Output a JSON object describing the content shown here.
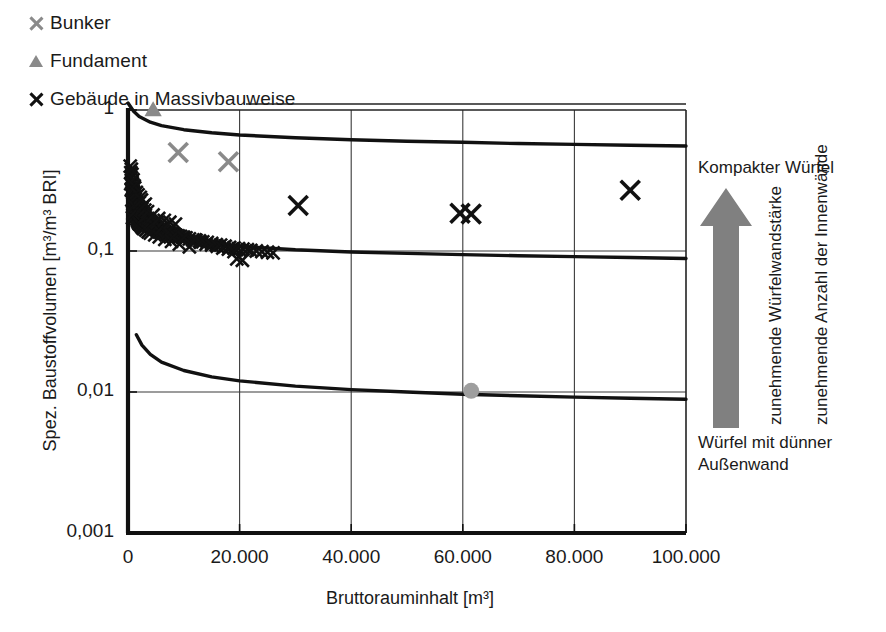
{
  "legend": {
    "items": [
      {
        "label": "Bunker",
        "marker": "x-icon",
        "color": "#8a8a8a"
      },
      {
        "label": "Fundament",
        "marker": "triangle-icon",
        "color": "#8a8a8a"
      },
      {
        "label": "Gebäude in Massivbauweise",
        "marker": "x-icon",
        "color": "#111111"
      }
    ]
  },
  "annotation": {
    "top_label": "Kompakter Würfel",
    "arrow_label_1": "zunehmende Würfelwandstärke",
    "arrow_label_2": "zunehmende Anzahl der Innenwände",
    "bottom_label_line1": "Würfel mit dünner",
    "bottom_label_line2": "Außenwand",
    "arrow_color": "#808080",
    "arrow_icon": "up-arrow-icon"
  },
  "chart_data": {
    "type": "scatter",
    "title": "",
    "xlabel": "Bruttorauminhalt [m³]",
    "ylabel": "Spez. Baustoffvolumen [m³/m³ BRI]",
    "xlim": [
      0,
      100000
    ],
    "ylim": [
      0.001,
      1
    ],
    "yscale": "log",
    "xscale": "linear",
    "xticks": [
      0,
      20000,
      40000,
      60000,
      80000,
      100000
    ],
    "xtick_labels": [
      "0",
      "20.000",
      "40.000",
      "60.000",
      "80.000",
      "100.000"
    ],
    "yticks": [
      1,
      0.1,
      0.01,
      0.001
    ],
    "ytick_labels": [
      "1",
      "0,1",
      "0,01",
      "0,001"
    ],
    "grid": true,
    "legend_position": "top-left-outside",
    "series": [
      {
        "name": "Gebäude in Massivbauweise",
        "marker": "x",
        "color": "#111111",
        "points": [
          [
            400,
            0.4
          ],
          [
            500,
            0.36
          ],
          [
            600,
            0.33
          ],
          [
            700,
            0.31
          ],
          [
            800,
            0.3
          ],
          [
            600,
            0.27
          ],
          [
            900,
            0.28
          ],
          [
            1000,
            0.26
          ],
          [
            1100,
            0.25
          ],
          [
            1200,
            0.24
          ],
          [
            700,
            0.23
          ],
          [
            1300,
            0.235
          ],
          [
            1400,
            0.225
          ],
          [
            900,
            0.215
          ],
          [
            1500,
            0.22
          ],
          [
            1600,
            0.21
          ],
          [
            1000,
            0.205
          ],
          [
            1700,
            0.2
          ],
          [
            1800,
            0.198
          ],
          [
            1200,
            0.195
          ],
          [
            1900,
            0.192
          ],
          [
            2000,
            0.19
          ],
          [
            1300,
            0.188
          ],
          [
            2100,
            0.186
          ],
          [
            2200,
            0.183
          ],
          [
            1400,
            0.181
          ],
          [
            2300,
            0.179
          ],
          [
            2400,
            0.177
          ],
          [
            1500,
            0.175
          ],
          [
            2500,
            0.173
          ],
          [
            800,
            0.172
          ],
          [
            2600,
            0.17
          ],
          [
            1600,
            0.169
          ],
          [
            2700,
            0.167
          ],
          [
            2800,
            0.166
          ],
          [
            1700,
            0.165
          ],
          [
            2900,
            0.164
          ],
          [
            3000,
            0.163
          ],
          [
            1800,
            0.162
          ],
          [
            3100,
            0.161
          ],
          [
            900,
            0.185
          ],
          [
            3200,
            0.16
          ],
          [
            1900,
            0.159
          ],
          [
            3300,
            0.158
          ],
          [
            3400,
            0.157
          ],
          [
            2000,
            0.156
          ],
          [
            1100,
            0.21
          ],
          [
            3600,
            0.155
          ],
          [
            2200,
            0.154
          ],
          [
            3800,
            0.152
          ],
          [
            500,
            0.3
          ],
          [
            4000,
            0.151
          ],
          [
            2400,
            0.15
          ],
          [
            4200,
            0.149
          ],
          [
            4400,
            0.148
          ],
          [
            2600,
            0.147
          ],
          [
            4600,
            0.146
          ],
          [
            4800,
            0.145
          ],
          [
            2800,
            0.144
          ],
          [
            5000,
            0.143
          ],
          [
            3000,
            0.175
          ],
          [
            5400,
            0.142
          ],
          [
            3200,
            0.141
          ],
          [
            5800,
            0.14
          ],
          [
            6200,
            0.138
          ],
          [
            3600,
            0.137
          ],
          [
            6600,
            0.136
          ],
          [
            7000,
            0.135
          ],
          [
            4000,
            0.134
          ],
          [
            7400,
            0.133
          ],
          [
            4400,
            0.155
          ],
          [
            7800,
            0.132
          ],
          [
            8200,
            0.131
          ],
          [
            4800,
            0.13
          ],
          [
            8600,
            0.129
          ],
          [
            5200,
            0.16
          ],
          [
            9000,
            0.128
          ],
          [
            9400,
            0.127
          ],
          [
            5600,
            0.126
          ],
          [
            9800,
            0.125
          ],
          [
            6000,
            0.145
          ],
          [
            10400,
            0.124
          ],
          [
            11000,
            0.122
          ],
          [
            6600,
            0.121
          ],
          [
            11600,
            0.12
          ],
          [
            7200,
            0.135
          ],
          [
            12200,
            0.119
          ],
          [
            12800,
            0.118
          ],
          [
            7800,
            0.117
          ],
          [
            13400,
            0.116
          ],
          [
            8400,
            0.13
          ],
          [
            14200,
            0.115
          ],
          [
            15000,
            0.113
          ],
          [
            9200,
            0.112
          ],
          [
            15800,
            0.111
          ],
          [
            10000,
            0.125
          ],
          [
            16600,
            0.11
          ],
          [
            17400,
            0.108
          ],
          [
            11000,
            0.107
          ],
          [
            18200,
            0.106
          ],
          [
            12000,
            0.12
          ],
          [
            19000,
            0.105
          ],
          [
            19800,
            0.104
          ],
          [
            13000,
            0.115
          ],
          [
            20600,
            0.103
          ],
          [
            14000,
            0.112
          ],
          [
            21400,
            0.102
          ],
          [
            22000,
            0.101
          ],
          [
            15000,
            0.11
          ],
          [
            23000,
            0.1
          ],
          [
            16000,
            0.108
          ],
          [
            24000,
            0.099
          ],
          [
            17000,
            0.105
          ],
          [
            25000,
            0.098
          ],
          [
            18000,
            0.103
          ],
          [
            26000,
            0.097
          ],
          [
            19000,
            0.099
          ],
          [
            19500,
            0.088
          ],
          [
            20500,
            0.086
          ],
          [
            30500,
            0.21
          ],
          [
            59500,
            0.185
          ],
          [
            61500,
            0.183
          ],
          [
            90000,
            0.27
          ],
          [
            2000,
            0.22
          ],
          [
            2500,
            0.2
          ],
          [
            3000,
            0.195
          ],
          [
            1200,
            0.28
          ],
          [
            1500,
            0.26
          ],
          [
            700,
            0.35
          ],
          [
            900,
            0.32
          ],
          [
            1100,
            0.29
          ],
          [
            2200,
            0.24
          ],
          [
            2800,
            0.21
          ],
          [
            600,
            0.38
          ],
          [
            3500,
            0.19
          ],
          [
            4500,
            0.18
          ],
          [
            5500,
            0.17
          ],
          [
            6500,
            0.165
          ],
          [
            7500,
            0.16
          ],
          [
            8500,
            0.155
          ],
          [
            1800,
            0.25
          ],
          [
            2400,
            0.23
          ],
          [
            3100,
            0.215
          ]
        ]
      },
      {
        "name": "Bunker",
        "marker": "x",
        "color": "#8a8a8a",
        "points": [
          [
            9000,
            0.5
          ],
          [
            18000,
            0.43
          ]
        ]
      },
      {
        "name": "Fundament",
        "marker": "triangle",
        "color": "#8a8a8a",
        "points": [
          [
            4500,
            1.0
          ]
        ]
      },
      {
        "name": "unlabeled-gray-circle",
        "marker": "circle",
        "color": "#9e9e9e",
        "points": [
          [
            61500,
            0.0102
          ]
        ]
      }
    ],
    "curves": [
      {
        "name": "upper-reference-curve",
        "color": "#111111",
        "points": [
          [
            0,
            1.12
          ],
          [
            1000,
            0.98
          ],
          [
            2000,
            0.9
          ],
          [
            4000,
            0.82
          ],
          [
            6000,
            0.775
          ],
          [
            10000,
            0.725
          ],
          [
            15000,
            0.69
          ],
          [
            20000,
            0.665
          ],
          [
            30000,
            0.635
          ],
          [
            40000,
            0.615
          ],
          [
            50000,
            0.6
          ],
          [
            60000,
            0.59
          ],
          [
            70000,
            0.578
          ],
          [
            80000,
            0.57
          ],
          [
            90000,
            0.562
          ],
          [
            100000,
            0.555
          ]
        ]
      },
      {
        "name": "middle-reference-curve",
        "color": "#111111",
        "points": [
          [
            0,
            0.175
          ],
          [
            1000,
            0.155
          ],
          [
            2000,
            0.145
          ],
          [
            4000,
            0.133
          ],
          [
            6000,
            0.126
          ],
          [
            10000,
            0.118
          ],
          [
            15000,
            0.112
          ],
          [
            20000,
            0.108
          ],
          [
            30000,
            0.102
          ],
          [
            40000,
            0.0985
          ],
          [
            50000,
            0.0962
          ],
          [
            60000,
            0.0942
          ],
          [
            70000,
            0.0925
          ],
          [
            80000,
            0.0912
          ],
          [
            90000,
            0.09
          ],
          [
            100000,
            0.0885
          ]
        ]
      },
      {
        "name": "lower-reference-curve",
        "color": "#111111",
        "points": [
          [
            1500,
            0.0255
          ],
          [
            2500,
            0.0215
          ],
          [
            4000,
            0.0185
          ],
          [
            6000,
            0.0163
          ],
          [
            10000,
            0.0142
          ],
          [
            15000,
            0.0128
          ],
          [
            20000,
            0.012
          ],
          [
            30000,
            0.011
          ],
          [
            40000,
            0.0104
          ],
          [
            50000,
            0.01
          ],
          [
            60000,
            0.00965
          ],
          [
            70000,
            0.0094
          ],
          [
            80000,
            0.0092
          ],
          [
            90000,
            0.00903
          ],
          [
            100000,
            0.00888
          ]
        ]
      }
    ]
  }
}
